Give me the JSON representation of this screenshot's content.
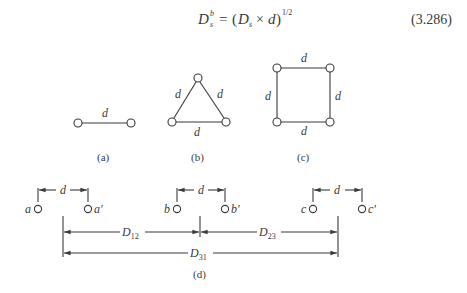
{
  "equation": {
    "lhs_base": "D",
    "lhs_sup": "b",
    "lhs_sub": "s",
    "equals": "=",
    "open": "(",
    "term1_base": "D",
    "term1_sub": "s",
    "times": "×",
    "term2": "d",
    "close": ")",
    "exponent": "1/2",
    "number": "(3.286)"
  },
  "figures": {
    "a": {
      "caption": "(a)",
      "edge_label": "d"
    },
    "b": {
      "caption": "(b)",
      "edge_labels": [
        "d",
        "d",
        "d"
      ]
    },
    "c": {
      "caption": "(c)",
      "edge_labels": [
        "d",
        "d",
        "d",
        "d"
      ]
    },
    "d": {
      "caption": "(d)",
      "conductors": [
        {
          "left": "a",
          "right": "a'",
          "spacing": "d"
        },
        {
          "left": "b",
          "right": "b'",
          "spacing": "d"
        },
        {
          "left": "c",
          "right": "c'",
          "spacing": "d"
        }
      ],
      "distances": [
        {
          "label": "D",
          "sub": "12"
        },
        {
          "label": "D",
          "sub": "23"
        },
        {
          "label": "D",
          "sub": "31"
        }
      ]
    }
  },
  "colors": {
    "stroke": "#3a3a3a",
    "background": "#ffffff"
  }
}
